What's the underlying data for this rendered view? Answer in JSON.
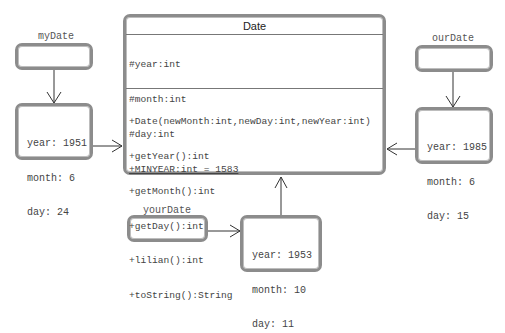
{
  "class": {
    "name": "Date",
    "attributes": [
      {
        "text": "#year:int",
        "static": false
      },
      {
        "text": "#month:int",
        "static": false
      },
      {
        "text": "#day:int",
        "static": false
      },
      {
        "text": "+MINYEAR:int = 1583",
        "static": true
      }
    ],
    "methods": [
      "+Date(newMonth:int,newDay:int,newYear:int)",
      "+getYear():int",
      "+getMonth():int",
      "+getDay():int",
      "+lilian():int",
      "+toString():String"
    ]
  },
  "references": [
    {
      "name": "myDate"
    },
    {
      "name": "ourDate"
    },
    {
      "name": "yourDate"
    }
  ],
  "objects": [
    {
      "year": "year: 1951",
      "month": "month: 6",
      "day": "day: 24"
    },
    {
      "year": "year: 1985",
      "month": "month: 6",
      "day": "day: 15"
    },
    {
      "year": "year: 1953",
      "month": "month: 10",
      "day": "day: 11"
    }
  ],
  "colors": {
    "border": "#8c8c8c",
    "line": "#333333"
  }
}
